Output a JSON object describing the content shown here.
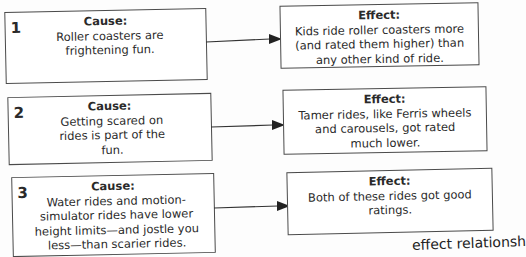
{
  "rows": [
    {
      "number": "1",
      "cause": {
        "label": "Cause:",
        "text": "Roller coasters are frightening fun."
      },
      "effect": {
        "label": "Effect:",
        "text": "Kids ride roller coasters more (and rated them higher) than any other kind of ride."
      }
    },
    {
      "number": "2",
      "cause": {
        "label": "Cause:",
        "text": "Getting scared on rides is part of the fun."
      },
      "effect": {
        "label": "Effect:",
        "text": "Tamer rides, like Ferris wheels and carousels, got rated much lower."
      }
    },
    {
      "number": "3",
      "cause": {
        "label": "Cause:",
        "text": "Water rides and motion-simulator rides have lower height limits—and jostle you less—than scarier rides."
      },
      "effect": {
        "label": "Effect:",
        "text": "Both of these rides got good ratings."
      }
    }
  ],
  "footer_fragment": "effect relationsh"
}
